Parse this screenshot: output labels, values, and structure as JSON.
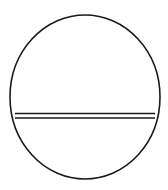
{
  "figure": {
    "width": 168,
    "height": 190,
    "background": "#ffffff",
    "stroke_color": "#1a1a1a",
    "circle": {
      "cx": 85,
      "cy": 97,
      "rx": 75,
      "ry": 82,
      "stroke_width": 1.6
    },
    "chord": {
      "x1": 15,
      "x2": 155,
      "y_top": 113.5,
      "y_bottom": 118,
      "stroke_width": 1.3
    }
  }
}
